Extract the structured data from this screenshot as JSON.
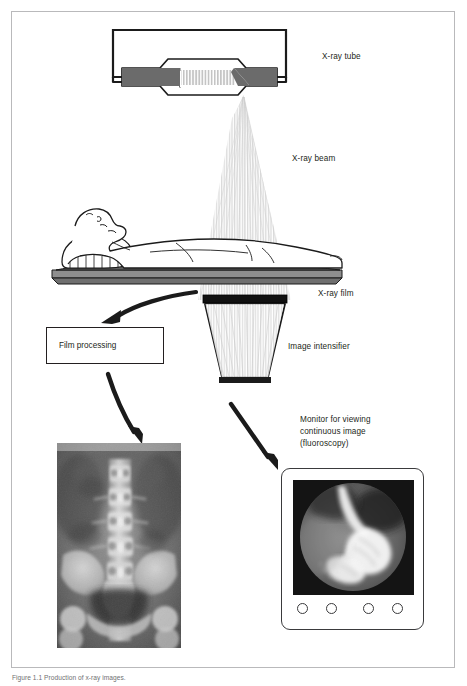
{
  "figure": {
    "domain": "diagram",
    "background": "#ffffff",
    "frame_color": "#b9b9bb"
  },
  "labels": {
    "xray_tube": "X-ray tube",
    "xray_beam": "X-ray beam",
    "xray_film": "X-ray film",
    "image_intensifier": "Image intensifier",
    "film_processing": "Film processing",
    "monitor_line1": "Monitor for viewing",
    "monitor_line2": "continuous image",
    "monitor_line3": "(fluoroscopy)"
  },
  "caption": {
    "text": "Figure 1.1 Production of x-ray images."
  },
  "components": [
    {
      "id": "xray-tube",
      "name": "x-ray-tube",
      "desc": "Sealed glass envelope with cathode filament at left and angled anode target at right; electron stream shown as vertical hatching between them"
    },
    {
      "id": "cathode",
      "name": "cathode",
      "color": "#6b6b6b"
    },
    {
      "id": "anode",
      "name": "anode",
      "color": "#6b6b6b"
    },
    {
      "id": "electron-beam",
      "name": "electron-beam",
      "color": "#c9c9c9"
    },
    {
      "id": "xray-beam",
      "name": "x-ray-beam-cone",
      "color": "#d8d8d8"
    },
    {
      "id": "patient",
      "name": "patient-supine",
      "desc": "Adult lying supine, head to the left, on a radiographic table with pillow"
    },
    {
      "id": "table",
      "name": "radiographic-table",
      "color": "#8e8e8e"
    },
    {
      "id": "film-cassette",
      "name": "x-ray-film-cassette",
      "color": "#1a1a1a"
    },
    {
      "id": "image-intensifier",
      "name": "image-intensifier",
      "desc": "Trapezoid tapering downward below the film plane"
    },
    {
      "id": "radiograph",
      "name": "lumbar-spine-radiograph",
      "desc": "Antero-posterior radiograph of the lumbar spine and pelvis"
    },
    {
      "id": "monitor",
      "name": "fluoroscopy-monitor",
      "desc": "Monitor with circular fluoroscopic image of a barium-filled stomach and duodenum, four round control buttons below"
    }
  ],
  "monitor": {
    "button_count": 4,
    "image_kind": "circular fluoroscopic barium study"
  },
  "colors": {
    "ink": "#231f20",
    "metal_gray": "#6b6b6b",
    "table_gray": "#8e8e8e",
    "beam_gray": "#d8d8d8",
    "frame": "#b9b9bb",
    "caption": "#6f7072"
  }
}
